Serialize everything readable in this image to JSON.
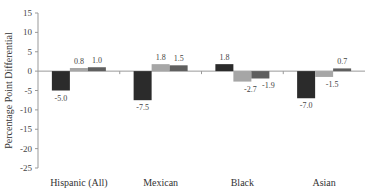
{
  "chart_data": {
    "type": "bar",
    "title": "",
    "xlabel": "",
    "ylabel": "Percentage Point Differential",
    "ylim": [
      -25,
      15
    ],
    "yticks": [
      15,
      10,
      5,
      0,
      -5,
      -10,
      -15,
      -20,
      -25
    ],
    "grid": false,
    "legend": null,
    "categories": [
      "Hispanic (All)",
      "Mexican",
      "Black",
      "Asian"
    ],
    "series": [
      {
        "name": "Series 1",
        "color": "#2b2b2b",
        "values": [
          -5.0,
          -7.5,
          1.8,
          -7.0
        ],
        "labels": [
          "-5.0",
          "-7.5",
          "1.8",
          "-7.0"
        ]
      },
      {
        "name": "Series 2",
        "color": "#a6a6a6",
        "values": [
          0.8,
          1.8,
          -2.7,
          -1.5
        ],
        "labels": [
          "0.8",
          "1.8",
          "-2.7",
          "-1.5"
        ]
      },
      {
        "name": "Series 3",
        "color": "#5f5f5f",
        "values": [
          1.0,
          1.5,
          -1.9,
          0.7
        ],
        "labels": [
          "1.0",
          "1.5",
          "-1.9",
          "0.7"
        ]
      }
    ]
  }
}
